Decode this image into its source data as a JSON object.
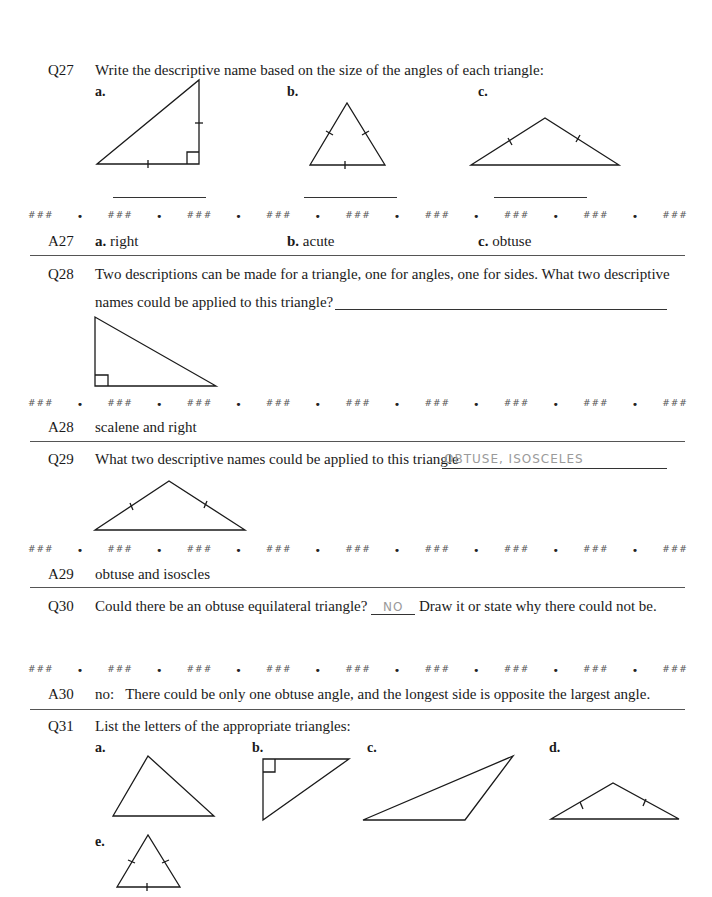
{
  "separator": {
    "mark": "###",
    "dot": "•",
    "count": 9
  },
  "q27": {
    "num": "Q27",
    "prompt": "Write the descriptive name based on the size of the angles of each triangle:",
    "labels": [
      "a.",
      "b.",
      "c."
    ]
  },
  "a27": {
    "num": "A27",
    "answers": [
      {
        "label": "a.",
        "text": "right"
      },
      {
        "label": "b.",
        "text": "acute"
      },
      {
        "label": "c.",
        "text": "obtuse"
      }
    ]
  },
  "q28": {
    "num": "Q28",
    "line1": "Two descriptions can be made for a triangle, one for angles, one for sides. What two descriptive",
    "line2": "names could be applied to this triangle?"
  },
  "a28": {
    "num": "A28",
    "text": "scalene and right"
  },
  "q29": {
    "num": "Q29",
    "prompt": "What two descriptive names could be applied to this triangle",
    "handwritten": "OBTUSE, ISOSCELES"
  },
  "a29": {
    "num": "A29",
    "text": "obtuse and isoscles"
  },
  "q30": {
    "num": "Q30",
    "prompt_before": "Could there be an obtuse equilateral triangle?",
    "handwritten": "NO",
    "prompt_after": "Draw it or state why there could not be."
  },
  "a30": {
    "num": "A30",
    "text": "no:   There could be only one obtuse angle, and the longest side is opposite the largest angle."
  },
  "q31": {
    "num": "Q31",
    "prompt": "List the letters of the appropriate triangles:",
    "labels": [
      "a.",
      "b.",
      "c.",
      "d.",
      "e."
    ]
  }
}
